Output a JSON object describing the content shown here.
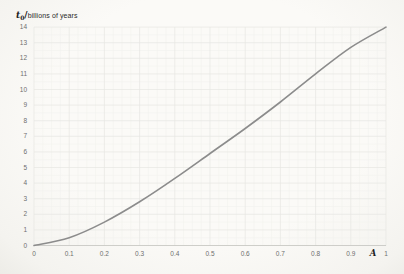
{
  "chart_data": {
    "type": "line",
    "title_variable": "t",
    "title_subscript": "0",
    "title_separator": "/",
    "title_unit": "billions of years",
    "xlabel": "A",
    "x": [
      0,
      0.1,
      0.2,
      0.3,
      0.4,
      0.5,
      0.6,
      0.7,
      0.8,
      0.9,
      1
    ],
    "values": [
      0,
      0.5,
      1.5,
      2.8,
      4.3,
      5.9,
      7.5,
      9.2,
      11.0,
      12.7,
      14.0
    ],
    "xlim": [
      0,
      1
    ],
    "ylim": [
      0,
      14
    ],
    "x_tick_labels": [
      "0",
      "0.1",
      "0.2",
      "0.3",
      "0.4",
      "0.5",
      "0.6",
      "0.7",
      "0.8",
      "0.9",
      "1"
    ],
    "y_tick_labels": [
      "0",
      "1",
      "2",
      "3",
      "4",
      "5",
      "6",
      "7",
      "8",
      "9",
      "10",
      "11",
      "12",
      "13",
      "14"
    ],
    "grid": "major+minor",
    "x_minor_step": 0.025,
    "y_minor_step": 0.5,
    "line_color": "#8c8c8c",
    "gridline_color": "#e7e7e3",
    "minor_gridline_color": "#f2f2ee",
    "axis_line_color": "#c8c8c4",
    "tick_label_color": "#6e6e6e",
    "title_color": "#222222",
    "legend": "none"
  }
}
